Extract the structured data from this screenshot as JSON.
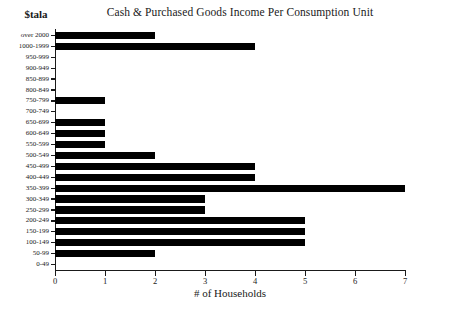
{
  "figure": {
    "title": "Cash & Purchased Goods Income Per Consumption Unit",
    "y_axis_title": "$tala",
    "x_axis_title": "# of Households"
  },
  "chart_data": {
    "type": "bar",
    "orientation": "horizontal",
    "title": "Cash & Purchased Goods Income Per Consumption Unit",
    "xlabel": "# of Households",
    "ylabel": "$tala",
    "xlim": [
      0,
      7
    ],
    "xticks": [
      "0",
      "1",
      "2",
      "3",
      "4",
      "5",
      "6",
      "7"
    ],
    "grid": false,
    "legend": null,
    "bar_color": "#000000",
    "categories": [
      "over 2000",
      "1000-1999",
      "950-999",
      "900-949",
      "850-899",
      "800-849",
      "750-799",
      "700-749",
      "650-699",
      "600-649",
      "550-599",
      "500-549",
      "450-499",
      "400-449",
      "350-399",
      "300-349",
      "250-299",
      "200-249",
      "150-199",
      "100-149",
      "50-99",
      "0-49"
    ],
    "values": [
      2,
      4,
      0,
      0,
      0,
      0,
      1,
      0,
      1,
      1,
      1,
      2,
      4,
      4,
      7,
      3,
      3,
      5,
      5,
      5,
      2,
      0
    ]
  }
}
